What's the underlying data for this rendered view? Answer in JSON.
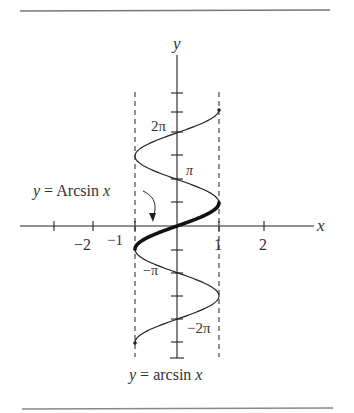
{
  "figure": {
    "title": "",
    "axis_labels": {
      "x": "x",
      "y": "y"
    },
    "x_ticks": [
      {
        "value": -3,
        "label": ""
      },
      {
        "value": -2,
        "label": "−2"
      },
      {
        "value": -1,
        "label": "−1"
      },
      {
        "value": 1,
        "label": "1"
      },
      {
        "value": 2,
        "label": "2"
      }
    ],
    "y_ticks": [
      {
        "value": "5π/2",
        "label": ""
      },
      {
        "value": "2π",
        "label": "2π"
      },
      {
        "value": "3π/2",
        "label": ""
      },
      {
        "value": "π",
        "label": "π"
      },
      {
        "value": "π/2",
        "label": ""
      },
      {
        "value": "-π/2",
        "label": ""
      },
      {
        "value": "-π",
        "label": "−π"
      },
      {
        "value": "-3π/2",
        "label": ""
      },
      {
        "value": "-2π",
        "label": "−2π"
      },
      {
        "value": "-5π/2",
        "label": ""
      }
    ],
    "annotations": {
      "principal": "y = Arcsin x",
      "multivalued": "y = arcsin x"
    },
    "labels": {
      "y_axis": "y",
      "x_axis": "x",
      "two_pi": "2π",
      "pi": "π",
      "neg_pi": "−π",
      "neg_two_pi": "−2π",
      "neg_two": "−2",
      "neg_one": "−1",
      "one": "1",
      "two": "2",
      "caption_y": "y",
      "caption_eq": " = arcsin ",
      "caption_x": "x",
      "arc_y": "y",
      "arc_eq": " = Arcsin ",
      "arc_x": "x"
    }
  },
  "chart_data": {
    "type": "line",
    "title": "",
    "xlabel": "x",
    "ylabel": "y",
    "xlim": [
      -3.3,
      3.3
    ],
    "ylim": [
      -8.5,
      10
    ],
    "grid": false,
    "series": [
      {
        "name": "y = arcsin x (multivalued, x = sin y)",
        "y_range": [
          "-5π/2",
          "5π/2"
        ],
        "style": "thin"
      },
      {
        "name": "y = Arcsin x (principal branch)",
        "y_range": [
          "-π/2",
          "π/2"
        ],
        "style": "thick"
      }
    ],
    "asymptote_lines": [
      {
        "x": -1,
        "style": "dashed"
      },
      {
        "x": 1,
        "style": "dashed"
      }
    ]
  }
}
